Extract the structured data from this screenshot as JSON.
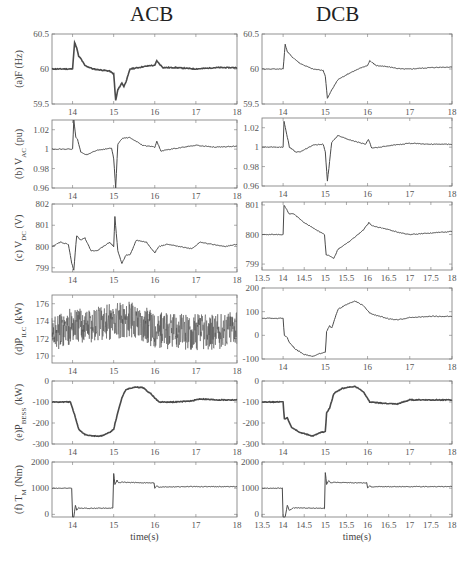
{
  "titles": {
    "left": "ACB",
    "right": "DCB"
  },
  "chart_data": [
    {
      "id": "a_acb",
      "type": "line",
      "column": "ACB",
      "ylabel": "(a)F (Hz)",
      "ylim": [
        59.5,
        60.5
      ],
      "yticks": [
        59.5,
        60,
        60.5
      ],
      "xlim": [
        13.5,
        18
      ],
      "xticks": [
        14,
        15,
        16,
        17,
        18
      ],
      "x": [
        13.5,
        13.9,
        14.0,
        14.05,
        14.1,
        14.15,
        14.2,
        14.3,
        14.5,
        14.9,
        15.0,
        15.05,
        15.1,
        15.2,
        15.25,
        15.3,
        15.4,
        15.6,
        15.9,
        16.0,
        16.05,
        16.1,
        16.2,
        16.5,
        17,
        17.5,
        18
      ],
      "y": [
        60.0,
        60.0,
        60.0,
        60.38,
        60.3,
        60.18,
        60.15,
        60.05,
        60.0,
        59.97,
        59.93,
        59.55,
        59.7,
        59.8,
        59.75,
        59.82,
        60.0,
        60.02,
        60.05,
        60.05,
        60.12,
        60.08,
        60.02,
        60.02,
        60.0,
        60.02,
        60.02
      ]
    },
    {
      "id": "a_dcb",
      "type": "line",
      "column": "DCB",
      "ylabel": "",
      "ylim": [
        59.5,
        60.5
      ],
      "yticks": [
        59.5,
        60,
        60.5
      ],
      "xlim": [
        13.5,
        18
      ],
      "xticks": [
        14,
        15,
        16,
        17,
        18
      ],
      "x": [
        13.5,
        14.0,
        14.05,
        14.1,
        14.2,
        14.4,
        14.7,
        14.95,
        15.0,
        15.05,
        15.15,
        15.3,
        15.6,
        15.9,
        16.0,
        16.05,
        16.2,
        16.5,
        16.8,
        17,
        17.5,
        18
      ],
      "y": [
        60.0,
        60.0,
        60.35,
        60.25,
        60.18,
        60.08,
        60.0,
        59.98,
        59.9,
        59.58,
        59.7,
        59.85,
        59.95,
        60.03,
        60.05,
        60.12,
        60.05,
        60.03,
        60.0,
        60.0,
        60.02,
        60.03
      ]
    },
    {
      "id": "b_acb",
      "type": "line",
      "column": "ACB",
      "ylabel": "(b) V_AC (pu)",
      "ylim": [
        0.96,
        1.03
      ],
      "yticks": [
        0.96,
        0.98,
        1,
        1.02
      ],
      "xlim": [
        13.5,
        18
      ],
      "xticks": [
        14,
        15,
        16,
        17,
        18
      ],
      "x": [
        13.5,
        14.0,
        14.03,
        14.08,
        14.12,
        14.2,
        14.35,
        14.6,
        14.95,
        15.0,
        15.05,
        15.1,
        15.2,
        15.4,
        15.7,
        16.0,
        16.05,
        16.15,
        16.4,
        17,
        17.5,
        18
      ],
      "y": [
        1.0,
        1.0,
        1.03,
        1.012,
        1.01,
        0.997,
        0.994,
        0.999,
        1.001,
        0.99,
        0.96,
        1.005,
        1.011,
        1.012,
        1.004,
        1.002,
        1.008,
        0.998,
        1.0,
        1.004,
        1.002,
        1.003
      ]
    },
    {
      "id": "b_dcb",
      "type": "line",
      "column": "DCB",
      "ylabel": "",
      "ylim": [
        0.96,
        1.03
      ],
      "yticks": [
        0.96,
        0.98,
        1,
        1.02
      ],
      "xlim": [
        13.5,
        18
      ],
      "xticks": [
        14,
        15,
        16,
        17,
        18
      ],
      "x": [
        13.5,
        14.0,
        14.02,
        14.15,
        14.3,
        14.4,
        14.7,
        14.95,
        15.0,
        15.05,
        15.15,
        15.3,
        15.6,
        15.95,
        16.02,
        16.1,
        16.3,
        16.6,
        17,
        17.5,
        18
      ],
      "y": [
        1.0,
        1.0,
        1.027,
        1.0,
        0.995,
        0.995,
        1.002,
        1.003,
        0.995,
        0.965,
        1.005,
        1.012,
        1.007,
        1.003,
        1.008,
        0.999,
        1.0,
        1.002,
        1.004,
        1.003,
        1.003
      ]
    },
    {
      "id": "c_acb",
      "type": "line",
      "column": "ACB",
      "ylabel": "(c) V_DC (V)",
      "ylim": [
        798.8,
        802
      ],
      "yticks": [
        799,
        800,
        801,
        802
      ],
      "xlim": [
        13.5,
        18
      ],
      "xticks": [
        14,
        15,
        16,
        17,
        18
      ],
      "x": [
        13.5,
        13.7,
        13.9,
        13.98,
        14.03,
        14.1,
        14.2,
        14.3,
        14.45,
        14.6,
        14.9,
        15.0,
        15.03,
        15.1,
        15.2,
        15.3,
        15.4,
        15.55,
        15.8,
        16.0,
        16.1,
        16.3,
        16.6,
        16.9,
        17.1,
        17.4,
        17.7,
        18
      ],
      "y": [
        800.0,
        800.2,
        800.1,
        799.2,
        798.9,
        800.5,
        800.3,
        800.4,
        799.8,
        799.8,
        800.2,
        800.0,
        801.4,
        799.8,
        799.2,
        799.6,
        799.6,
        800.3,
        800.2,
        799.7,
        800.0,
        800.1,
        800.0,
        799.9,
        800.2,
        800.1,
        800.0,
        800.1
      ]
    },
    {
      "id": "c_dcb",
      "type": "line",
      "column": "DCB",
      "ylabel": "",
      "ylim": [
        798.8,
        801.1
      ],
      "yticks": [
        799,
        800,
        801
      ],
      "xlim": [
        13.5,
        18
      ],
      "xticks": [
        13.5,
        14,
        14.5,
        15,
        15.5,
        16,
        16.5,
        17,
        17.5,
        18
      ],
      "x": [
        13.5,
        14.0,
        14.02,
        14.1,
        14.15,
        14.25,
        14.5,
        14.8,
        14.98,
        15.02,
        15.08,
        15.2,
        15.3,
        15.6,
        15.9,
        16.03,
        16.1,
        16.4,
        16.8,
        17.0,
        17.5,
        18
      ],
      "y": [
        800.0,
        800.0,
        801.0,
        800.8,
        800.7,
        800.7,
        800.4,
        800.15,
        800.0,
        799.3,
        799.3,
        799.2,
        799.5,
        799.8,
        800.15,
        800.4,
        800.3,
        800.2,
        800.05,
        800.0,
        800.05,
        800.1
      ]
    },
    {
      "id": "d_acb",
      "type": "line",
      "column": "ACB",
      "ylabel": "(d)P_ILC (kW)",
      "ylim": [
        169.2,
        177
      ],
      "yticks": [
        170,
        172,
        174,
        176
      ],
      "xlim": [
        13.5,
        18
      ],
      "xticks": [
        14,
        15,
        16,
        17,
        18
      ],
      "note": "noisy signal oscillating 170-176 kW",
      "x": [
        13.5,
        14.0,
        14.5,
        15.0,
        15.5,
        16.0,
        16.5,
        17.0,
        17.5,
        18
      ],
      "y": [
        172.5,
        173.5,
        173.5,
        174.0,
        174.2,
        173.0,
        172.8,
        172.7,
        172.8,
        173.5
      ]
    },
    {
      "id": "d_dcb",
      "type": "line",
      "column": "DCB",
      "ylabel": "",
      "ylim": [
        -100,
        200
      ],
      "yticks": [
        -100,
        0,
        100,
        200
      ],
      "xlim": [
        13.5,
        18
      ],
      "xticks": [
        14,
        15,
        16,
        17,
        18
      ],
      "x": [
        13.5,
        14.0,
        14.03,
        14.1,
        14.15,
        14.3,
        14.5,
        14.7,
        14.9,
        15.0,
        15.03,
        15.1,
        15.15,
        15.3,
        15.5,
        15.7,
        15.9,
        16.05,
        16.2,
        16.5,
        16.7,
        17.0,
        17.5,
        18
      ],
      "y": [
        72,
        72,
        0,
        -10,
        -30,
        -60,
        -80,
        -90,
        -75,
        -70,
        15,
        40,
        30,
        110,
        130,
        145,
        125,
        95,
        85,
        70,
        65,
        75,
        80,
        80
      ]
    },
    {
      "id": "e_acb",
      "type": "line",
      "column": "ACB",
      "ylabel": "(e)P_BESS (kW)",
      "ylim": [
        -300,
        0
      ],
      "yticks": [
        -300,
        -200,
        -100,
        0
      ],
      "xlim": [
        13.5,
        18
      ],
      "xticks": [
        14,
        15,
        16,
        17,
        18
      ],
      "x": [
        13.5,
        13.95,
        14.05,
        14.15,
        14.3,
        14.5,
        14.7,
        14.9,
        15.0,
        15.1,
        15.2,
        15.3,
        15.5,
        15.7,
        15.9,
        16.1,
        16.5,
        16.9,
        17.1,
        17.5,
        18
      ],
      "y": [
        -100,
        -100,
        -160,
        -230,
        -255,
        -262,
        -262,
        -245,
        -230,
        -150,
        -80,
        -40,
        -30,
        -30,
        -60,
        -100,
        -100,
        -95,
        -85,
        -90,
        -90
      ]
    },
    {
      "id": "e_dcb",
      "type": "line",
      "column": "DCB",
      "ylabel": "",
      "ylim": [
        -300,
        0
      ],
      "yticks": [
        -300,
        -200,
        -100,
        0
      ],
      "xlim": [
        13.5,
        18
      ],
      "xticks": [
        14,
        15,
        16,
        17,
        18
      ],
      "x": [
        13.5,
        14.0,
        14.03,
        14.1,
        14.2,
        14.4,
        14.7,
        14.9,
        15.0,
        15.03,
        15.1,
        15.2,
        15.4,
        15.7,
        15.9,
        16.05,
        16.3,
        16.7,
        17.0,
        17.5,
        18
      ],
      "y": [
        -100,
        -100,
        -180,
        -175,
        -220,
        -245,
        -262,
        -245,
        -240,
        -150,
        -130,
        -60,
        -35,
        -25,
        -50,
        -100,
        -105,
        -110,
        -90,
        -90,
        -90
      ]
    },
    {
      "id": "f_acb",
      "type": "line",
      "column": "ACB",
      "ylabel": "(f) T_M (Nm)",
      "ylim": [
        -100,
        2000
      ],
      "yticks": [
        0,
        1000,
        2000
      ],
      "xlim": [
        13.5,
        18
      ],
      "xticks": [
        14,
        15,
        16,
        17,
        18
      ],
      "xlabel": "time(s)",
      "x": [
        13.5,
        13.98,
        14.0,
        14.03,
        14.07,
        14.1,
        14.15,
        14.25,
        14.98,
        15.0,
        15.03,
        15.08,
        15.12,
        15.2,
        15.3,
        15.98,
        16.0,
        16.05,
        16.1,
        16.2,
        17,
        18
      ],
      "y": [
        1000,
        1000,
        -100,
        -100,
        350,
        150,
        250,
        230,
        240,
        1550,
        1150,
        1300,
        1200,
        1230,
        1220,
        1200,
        1000,
        1100,
        1040,
        1050,
        1060,
        1060
      ]
    },
    {
      "id": "f_dcb",
      "type": "line",
      "column": "DCB",
      "ylabel": "",
      "ylim": [
        -100,
        2000
      ],
      "yticks": [
        0,
        1000,
        2000
      ],
      "xlim": [
        13.5,
        18
      ],
      "xticks": [
        13.5,
        14,
        14.5,
        15,
        15.5,
        16,
        16.5,
        17,
        17.5,
        18
      ],
      "xlabel": "time(s)",
      "x": [
        13.5,
        13.98,
        14.0,
        14.05,
        14.1,
        14.15,
        14.25,
        14.98,
        15.0,
        15.03,
        15.08,
        15.12,
        15.2,
        15.3,
        15.98,
        16.0,
        16.05,
        16.1,
        16.2,
        17,
        18
      ],
      "y": [
        1000,
        1000,
        -100,
        -100,
        350,
        150,
        250,
        230,
        1600,
        1150,
        1300,
        1200,
        1230,
        1220,
        1200,
        1000,
        1100,
        1040,
        1060,
        1060,
        1060
      ]
    }
  ]
}
